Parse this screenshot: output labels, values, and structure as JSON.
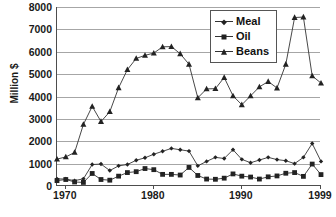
{
  "chart_data": {
    "type": "line",
    "title": "",
    "xlabel": "",
    "ylabel": "Million $",
    "ylim": [
      0,
      8000
    ],
    "ytick_labels": [
      "0",
      "1000",
      "2000",
      "3000",
      "4000",
      "5000",
      "6000",
      "7000",
      "8000"
    ],
    "ytick_values": [
      0,
      1000,
      2000,
      3000,
      4000,
      5000,
      6000,
      7000,
      8000
    ],
    "xtick_labels": [
      "1970",
      "1980",
      "1990",
      "1999"
    ],
    "xtick_values": [
      1970,
      1980,
      1990,
      1999
    ],
    "xlim": [
      1969,
      1999
    ],
    "grid": true,
    "legend_position": "top-right",
    "x": [
      1969,
      1970,
      1971,
      1972,
      1973,
      1974,
      1975,
      1976,
      1977,
      1978,
      1979,
      1980,
      1981,
      1982,
      1983,
      1984,
      1985,
      1986,
      1987,
      1988,
      1989,
      1990,
      1991,
      1992,
      1993,
      1994,
      1995,
      1996,
      1997,
      1998,
      1999
    ],
    "series": [
      {
        "name": "Meal",
        "marker": "diamond",
        "values": [
          320,
          310,
          240,
          320,
          960,
          980,
          690,
          900,
          960,
          1150,
          1260,
          1420,
          1550,
          1680,
          1620,
          1560,
          900,
          1100,
          1280,
          1230,
          1620,
          1190,
          1040,
          1160,
          1280,
          1180,
          1130,
          1000,
          1280,
          1900,
          1100
        ]
      },
      {
        "name": "Oil",
        "marker": "square",
        "values": [
          240,
          290,
          180,
          160,
          560,
          290,
          260,
          440,
          600,
          640,
          780,
          730,
          520,
          520,
          490,
          830,
          470,
          310,
          300,
          350,
          540,
          440,
          400,
          310,
          410,
          450,
          570,
          600,
          430,
          980,
          510
        ]
      },
      {
        "name": "Beans",
        "marker": "triangle",
        "values": [
          1200,
          1300,
          1500,
          2750,
          3560,
          2880,
          3320,
          4390,
          5200,
          5700,
          5840,
          5940,
          6220,
          6230,
          5910,
          5440,
          3940,
          4340,
          4350,
          4850,
          4030,
          3630,
          4030,
          4430,
          4670,
          4380,
          5440,
          7530,
          7550,
          4920,
          4600
        ]
      }
    ],
    "legend_entries": [
      {
        "label": "Meal",
        "marker": "diamond"
      },
      {
        "label": "Oil",
        "marker": "square"
      },
      {
        "label": "Beans",
        "marker": "triangle"
      }
    ],
    "colors": {
      "series_line": "#333333",
      "marker": "#222222",
      "gridline": "#a6a6a6",
      "axis": "#4d4d4d",
      "text": "#1a1a1a",
      "background": "#ffffff"
    }
  }
}
